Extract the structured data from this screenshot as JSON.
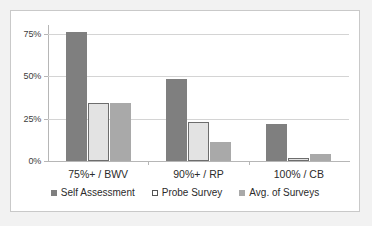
{
  "chart_data": {
    "type": "bar",
    "title": "",
    "subtitle": "",
    "xlabel": "",
    "ylabel": "",
    "categories": [
      "75%+ / BWV",
      "90%+ / RP",
      "100% / CB"
    ],
    "series": [
      {
        "name": "Self Assessment",
        "values": [
          76,
          48,
          22
        ],
        "color": "#7f7f7f"
      },
      {
        "name": "Probe Survey",
        "values": [
          34,
          23,
          2
        ],
        "color": "#e3e3e3"
      },
      {
        "name": "Avg. of Surveys",
        "values": [
          34,
          11,
          4
        ],
        "color": "#a9a9a9"
      }
    ],
    "ylim": [
      0,
      80
    ],
    "y_ticks": [
      0,
      25,
      50,
      75
    ],
    "y_tick_labels": [
      "0%",
      "25%",
      "50%",
      "75%"
    ],
    "grid": "horizontal",
    "legend_position": "bottom",
    "annotations": []
  },
  "figure": {
    "background_color": "#f2f2f2",
    "plot_background_color": "#ffffff",
    "border_color": "#c9c9c9",
    "gridline_color": "#d4d4d4",
    "axis_color": "#b6b6b6"
  }
}
